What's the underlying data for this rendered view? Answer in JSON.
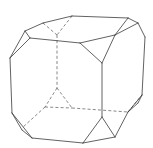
{
  "figure": {
    "style": {
      "line_color": "#3a3a3a",
      "hidden_line_color": "#555555",
      "background": "#ffffff"
    },
    "visible_edges": [
      [
        [
          43,
          23
        ],
        [
          72,
          16
        ]
      ],
      [
        [
          72,
          16
        ],
        [
          128,
          18
        ]
      ],
      [
        [
          128,
          18
        ],
        [
          138,
          23
        ]
      ],
      [
        [
          138,
          23
        ],
        [
          145,
          37
        ]
      ],
      [
        [
          145,
          37
        ],
        [
          142,
          95
        ]
      ],
      [
        [
          142,
          95
        ],
        [
          128,
          112
        ]
      ],
      [
        [
          128,
          112
        ],
        [
          115,
          137
        ]
      ],
      [
        [
          115,
          137
        ],
        [
          83,
          143
        ]
      ],
      [
        [
          83,
          143
        ],
        [
          32,
          138
        ]
      ],
      [
        [
          32,
          138
        ],
        [
          12,
          113
        ]
      ],
      [
        [
          12,
          113
        ],
        [
          10,
          58
        ]
      ],
      [
        [
          10,
          58
        ],
        [
          25,
          31
        ]
      ],
      [
        [
          25,
          31
        ],
        [
          43,
          23
        ]
      ],
      [
        [
          25,
          31
        ],
        [
          30,
          38
        ]
      ],
      [
        [
          30,
          38
        ],
        [
          10,
          58
        ]
      ],
      [
        [
          30,
          38
        ],
        [
          80,
          43
        ]
      ],
      [
        [
          80,
          43
        ],
        [
          115,
          35
        ]
      ],
      [
        [
          115,
          35
        ],
        [
          128,
          18
        ]
      ],
      [
        [
          115,
          35
        ],
        [
          138,
          23
        ]
      ],
      [
        [
          80,
          43
        ],
        [
          102,
          63
        ]
      ],
      [
        [
          115,
          35
        ],
        [
          102,
          63
        ]
      ],
      [
        [
          102,
          63
        ],
        [
          102,
          117
        ]
      ],
      [
        [
          102,
          117
        ],
        [
          115,
          137
        ]
      ],
      [
        [
          102,
          117
        ],
        [
          83,
          143
        ]
      ],
      [
        [
          12,
          113
        ],
        [
          22,
          130
        ]
      ],
      [
        [
          22,
          130
        ],
        [
          32,
          138
        ]
      ],
      [
        [
          128,
          112
        ],
        [
          138,
          103
        ]
      ],
      [
        [
          138,
          103
        ],
        [
          142,
          95
        ]
      ]
    ],
    "hidden_edges": [
      [
        [
          43,
          23
        ],
        [
          57,
          35
        ]
      ],
      [
        [
          72,
          16
        ],
        [
          57,
          35
        ]
      ],
      [
        [
          57,
          35
        ],
        [
          57,
          88
        ]
      ],
      [
        [
          57,
          88
        ],
        [
          45,
          107
        ]
      ],
      [
        [
          57,
          88
        ],
        [
          72,
          108
        ]
      ],
      [
        [
          45,
          107
        ],
        [
          72,
          108
        ]
      ],
      [
        [
          45,
          107
        ],
        [
          22,
          128
        ]
      ],
      [
        [
          72,
          108
        ],
        [
          128,
          112
        ]
      ],
      [
        [
          128,
          112
        ],
        [
          142,
          95
        ]
      ]
    ]
  }
}
